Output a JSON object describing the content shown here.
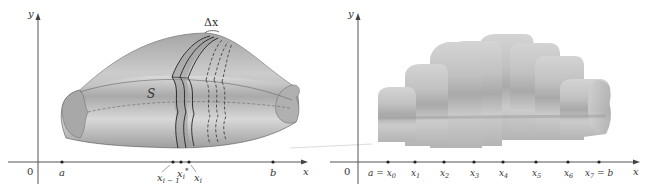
{
  "left_panel": {
    "axis_x_label": "x",
    "axis_y_label": "y",
    "origin_label": "0",
    "surface_label": "S",
    "delta_label": "Δx",
    "ticks": [
      {
        "label": "a",
        "x": 62
      },
      {
        "label": "x",
        "sub": "i − 1",
        "x": 173
      },
      {
        "label": "x",
        "sub": "i",
        "sup": "*",
        "x": 181
      },
      {
        "label": "x",
        "sub": "i",
        "x": 189
      },
      {
        "label": "b",
        "x": 273
      }
    ]
  },
  "right_panel": {
    "axis_x_label": "x",
    "axis_y_label": "y",
    "origin_label": "0",
    "ticks": [
      {
        "label": "a = x",
        "sub": "0",
        "x": 388
      },
      {
        "label": "x",
        "sub": "1",
        "x": 415
      },
      {
        "label": "x",
        "sub": "2",
        "x": 444
      },
      {
        "label": "x",
        "sub": "3",
        "x": 474
      },
      {
        "label": "x",
        "sub": "4",
        "x": 503
      },
      {
        "label": "x",
        "sub": "5",
        "x": 536
      },
      {
        "label": "x",
        "sub": "6",
        "x": 568
      },
      {
        "label": "x",
        "sub": "7",
        "suffix": " = b",
        "x": 599
      }
    ],
    "slab_count": 7
  },
  "colors": {
    "surface_light": "#d9d9d9",
    "surface_mid": "#b5b5b5",
    "surface_dark": "#8f8f8f",
    "axis": "#555555"
  }
}
